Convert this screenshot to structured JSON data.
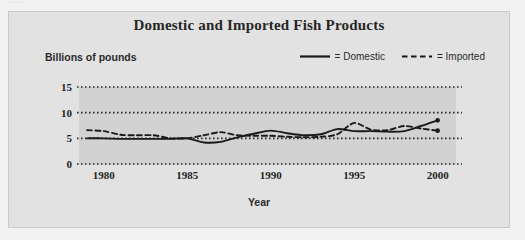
{
  "scan": {
    "cut_off_header_text": "......."
  },
  "figure": {
    "title": "Domestic and Imported Fish Products",
    "y_axis_title": "Billions of pounds",
    "x_axis_title": "Year",
    "legend": [
      {
        "label": "= Domestic",
        "style": "solid",
        "icon": "solid-line-icon"
      },
      {
        "label": "= Imported",
        "style": "dashed",
        "icon": "dashed-line-icon"
      }
    ]
  },
  "colors": {
    "page_background": "#f2f2f2",
    "panel_background": "#e2e2e2",
    "plot_background": "#d2d2d2",
    "line": "#1a1a1a",
    "gridline": "#2a2a2a",
    "text": "#262626"
  },
  "chart_data": {
    "type": "line",
    "title": "Domestic and Imported Fish Products",
    "xlabel": "Year",
    "ylabel": "Billions of pounds",
    "xlim": [
      1979,
      2000.5
    ],
    "ylim": [
      0,
      15
    ],
    "yticks": [
      0,
      5,
      10,
      15
    ],
    "xticks": [
      1980,
      1985,
      1990,
      1995,
      2000
    ],
    "grid": true,
    "grid_style": "dotted horizontal",
    "legend_position": "top-right",
    "x": [
      1979,
      1980,
      1981,
      1982,
      1983,
      1984,
      1985,
      1986,
      1987,
      1988,
      1989,
      1990,
      1991,
      1992,
      1993,
      1994,
      1995,
      1996,
      1997,
      1998,
      1999,
      2000
    ],
    "series": [
      {
        "name": "Domestic",
        "style": "solid",
        "values": [
          5.0,
          5.0,
          4.9,
          4.9,
          4.9,
          4.9,
          5.0,
          4.2,
          4.3,
          5.2,
          5.9,
          6.5,
          6.0,
          5.6,
          5.8,
          6.8,
          6.4,
          6.4,
          6.3,
          6.4,
          7.4,
          8.5
        ]
      },
      {
        "name": "Imported",
        "style": "dashed",
        "values": [
          6.6,
          6.4,
          5.7,
          5.6,
          5.6,
          5.0,
          5.0,
          5.6,
          6.2,
          5.6,
          5.5,
          5.5,
          5.3,
          5.2,
          5.3,
          5.8,
          8.0,
          6.7,
          6.6,
          7.4,
          6.9,
          6.5
        ]
      }
    ],
    "endpoint_markers": [
      {
        "series": "Domestic",
        "x": 2000,
        "y": 8.5
      },
      {
        "series": "Imported",
        "x": 2000,
        "y": 6.5
      }
    ]
  }
}
